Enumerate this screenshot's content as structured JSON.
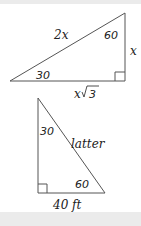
{
  "diagram": {
    "triangle_top": {
      "hypotenuse_label": "2x",
      "angle_top_right": "60",
      "angle_left": "30",
      "vertical_side_label": "x",
      "base_label_x": "x",
      "base_label_root": "3",
      "right_angle": "bottom-right"
    },
    "triangle_bottom": {
      "angle_top": "30",
      "hypotenuse_label": "latter",
      "angle_bottom_right": "60",
      "base_label": "40 ft",
      "right_angle": "bottom-left"
    },
    "colors": {
      "line": "#555555",
      "text": "#222222",
      "bars": "#ebebeb"
    }
  }
}
